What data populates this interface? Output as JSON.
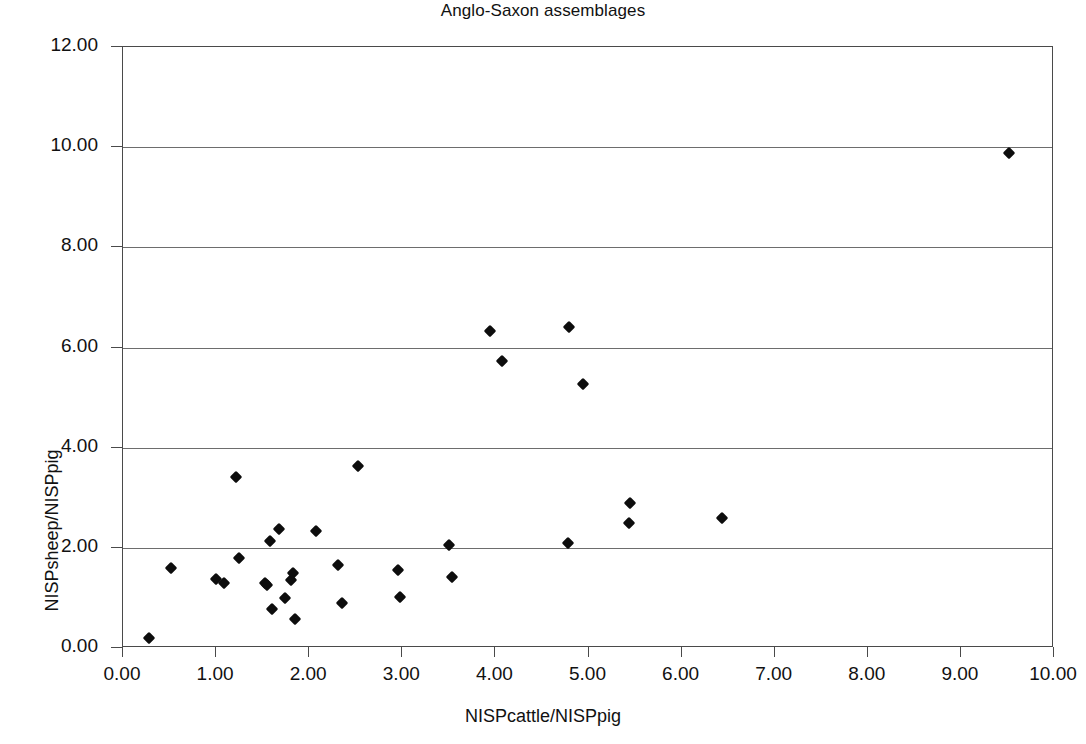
{
  "chart_data": {
    "type": "scatter",
    "title": "Anglo-Saxon assemblages",
    "xlabel": "NISPcattle/NISPpig",
    "ylabel": "NISPsheep/NISPpig",
    "xlim": [
      0,
      10
    ],
    "ylim": [
      0,
      12
    ],
    "xticks": [
      "0.00",
      "1.00",
      "2.00",
      "3.00",
      "4.00",
      "5.00",
      "6.00",
      "7.00",
      "8.00",
      "9.00",
      "10.00"
    ],
    "yticks": [
      "0.00",
      "2.00",
      "4.00",
      "6.00",
      "8.00",
      "10.00",
      "12.00"
    ],
    "xtick_values": [
      0,
      1,
      2,
      3,
      4,
      5,
      6,
      7,
      8,
      9,
      10
    ],
    "ytick_values": [
      0,
      2,
      4,
      6,
      8,
      10,
      12
    ],
    "grid": "horizontal",
    "legend": null,
    "marker_style": "filled-diamond",
    "marker_color": "#0d0d0d",
    "points": [
      {
        "x": 0.28,
        "y": 0.2
      },
      {
        "x": 0.52,
        "y": 1.6
      },
      {
        "x": 1.0,
        "y": 1.38
      },
      {
        "x": 1.09,
        "y": 1.3
      },
      {
        "x": 1.21,
        "y": 3.42
      },
      {
        "x": 1.25,
        "y": 1.8
      },
      {
        "x": 1.52,
        "y": 1.3
      },
      {
        "x": 1.55,
        "y": 1.25
      },
      {
        "x": 1.58,
        "y": 2.13
      },
      {
        "x": 1.6,
        "y": 0.78
      },
      {
        "x": 1.68,
        "y": 2.37
      },
      {
        "x": 1.74,
        "y": 1.0
      },
      {
        "x": 1.8,
        "y": 1.35
      },
      {
        "x": 1.83,
        "y": 1.5
      },
      {
        "x": 1.85,
        "y": 0.58
      },
      {
        "x": 2.07,
        "y": 2.34
      },
      {
        "x": 2.31,
        "y": 1.65
      },
      {
        "x": 2.35,
        "y": 0.9
      },
      {
        "x": 2.52,
        "y": 3.63
      },
      {
        "x": 2.95,
        "y": 1.55
      },
      {
        "x": 2.97,
        "y": 1.02
      },
      {
        "x": 3.5,
        "y": 2.06
      },
      {
        "x": 3.53,
        "y": 1.42
      },
      {
        "x": 3.94,
        "y": 6.32
      },
      {
        "x": 4.07,
        "y": 5.74
      },
      {
        "x": 4.79,
        "y": 6.4
      },
      {
        "x": 4.78,
        "y": 2.1
      },
      {
        "x": 4.94,
        "y": 5.28
      },
      {
        "x": 5.43,
        "y": 2.5
      },
      {
        "x": 5.45,
        "y": 2.9
      },
      {
        "x": 6.43,
        "y": 2.6
      },
      {
        "x": 9.52,
        "y": 9.88
      }
    ]
  }
}
